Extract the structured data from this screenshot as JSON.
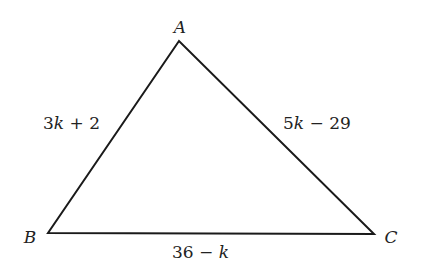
{
  "diagram": {
    "type": "triangle",
    "stroke_color": "#1a1a1a",
    "vertices": [
      {
        "name": "A",
        "label": "A",
        "x": 179,
        "y": 41
      },
      {
        "name": "B",
        "label": "B",
        "x": 48,
        "y": 233
      },
      {
        "name": "C",
        "label": "C",
        "x": 374,
        "y": 234
      }
    ],
    "sides": {
      "AB": {
        "coef_part": "3",
        "var": "k",
        "rest": " + 2",
        "full": "3k + 2"
      },
      "AC": {
        "coef_part": "5",
        "var": "k",
        "rest": " − 29",
        "full": "5k − 29"
      },
      "BC": {
        "pre": "36 − ",
        "var": "k",
        "full": "36 − k"
      }
    }
  }
}
